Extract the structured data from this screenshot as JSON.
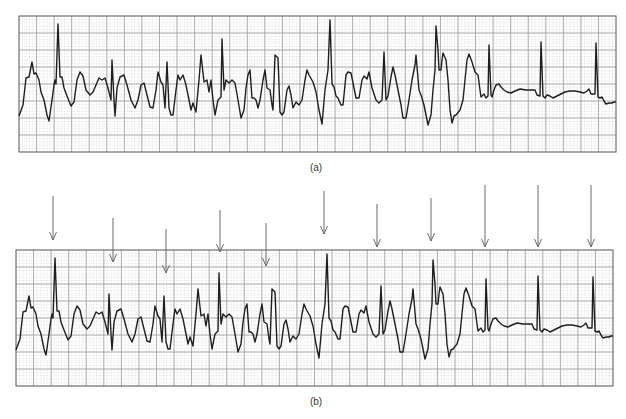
{
  "figure": {
    "panels": [
      {
        "id": "a",
        "label": "(a)",
        "box": {
          "x": 19,
          "y": 16,
          "w": 597,
          "h": 136
        },
        "label_pos": {
          "x": 316,
          "y": 162
        }
      },
      {
        "id": "b",
        "label": "(b)",
        "box": {
          "x": 16,
          "y": 250,
          "w": 597,
          "h": 136
        },
        "label_pos": {
          "x": 316,
          "y": 396
        }
      }
    ],
    "grid": {
      "major_step_x": 17.56,
      "major_step_y": 17,
      "minor_div": 5,
      "major_color": "#9a9a9a",
      "minor_color": "#c8c8c8",
      "border_color": "#555555"
    },
    "trace_color": "#1e1e1e",
    "arrow_color": "#6a6a6a"
  },
  "chart_data": {
    "type": "line",
    "title": "",
    "xlabel": "",
    "ylabel": "",
    "series": [
      {
        "name": "ECG trace (a), pixel coords within figure",
        "points": [
          [
            19,
            116
          ],
          [
            23,
            105
          ],
          [
            26,
            78
          ],
          [
            29,
            77
          ],
          [
            32,
            62
          ],
          [
            34,
            74
          ],
          [
            36,
            73
          ],
          [
            39,
            80
          ],
          [
            41,
            92
          ],
          [
            44,
            100
          ],
          [
            47,
            115
          ],
          [
            49,
            121
          ],
          [
            52,
            100
          ],
          [
            54,
            85
          ],
          [
            55,
            80
          ],
          [
            56,
            84
          ],
          [
            58,
            24
          ],
          [
            60,
            77
          ],
          [
            62,
            77
          ],
          [
            64,
            88
          ],
          [
            67,
            96
          ],
          [
            71,
            106
          ],
          [
            74,
            102
          ],
          [
            77,
            80
          ],
          [
            80,
            72
          ],
          [
            83,
            76
          ],
          [
            86,
            90
          ],
          [
            90,
            95
          ],
          [
            93,
            92
          ],
          [
            96,
            85
          ],
          [
            99,
            78
          ],
          [
            102,
            80
          ],
          [
            105,
            78
          ],
          [
            108,
            88
          ],
          [
            111,
            100
          ],
          [
            112,
            60
          ],
          [
            114,
            100
          ],
          [
            115,
            116
          ],
          [
            117,
            88
          ],
          [
            120,
            77
          ],
          [
            124,
            75
          ],
          [
            127,
            85
          ],
          [
            131,
            100
          ],
          [
            135,
            108
          ],
          [
            138,
            100
          ],
          [
            141,
            85
          ],
          [
            144,
            83
          ],
          [
            147,
            95
          ],
          [
            150,
            107
          ],
          [
            153,
            108
          ],
          [
            156,
            90
          ],
          [
            158,
            72
          ],
          [
            161,
            82
          ],
          [
            163,
            85
          ],
          [
            165,
            108
          ],
          [
            167,
            62
          ],
          [
            169,
            108
          ],
          [
            171,
            115
          ],
          [
            173,
            115
          ],
          [
            176,
            90
          ],
          [
            178,
            75
          ],
          [
            180,
            80
          ],
          [
            183,
            75
          ],
          [
            186,
            85
          ],
          [
            189,
            100
          ],
          [
            191,
            110
          ],
          [
            193,
            103
          ],
          [
            196,
            112
          ],
          [
            199,
            80
          ],
          [
            201,
            55
          ],
          [
            204,
            82
          ],
          [
            207,
            80
          ],
          [
            209,
            92
          ],
          [
            211,
            80
          ],
          [
            213,
            100
          ],
          [
            215,
            115
          ],
          [
            218,
            100
          ],
          [
            221,
            97
          ],
          [
            222,
            39
          ],
          [
            224,
            90
          ],
          [
            226,
            80
          ],
          [
            229,
            83
          ],
          [
            232,
            80
          ],
          [
            235,
            83
          ],
          [
            238,
            100
          ],
          [
            241,
            118
          ],
          [
            244,
            110
          ],
          [
            246,
            88
          ],
          [
            248,
            75
          ],
          [
            250,
            70
          ],
          [
            252,
            98
          ],
          [
            254,
            98
          ],
          [
            256,
            100
          ],
          [
            258,
            108
          ],
          [
            260,
            100
          ],
          [
            263,
            80
          ],
          [
            265,
            70
          ],
          [
            267,
            88
          ],
          [
            270,
            90
          ],
          [
            272,
            105
          ],
          [
            273,
            110
          ],
          [
            275,
            55
          ],
          [
            278,
            58
          ],
          [
            280,
            112
          ],
          [
            282,
            115
          ],
          [
            284,
            112
          ],
          [
            287,
            90
          ],
          [
            289,
            86
          ],
          [
            291,
            95
          ],
          [
            293,
            108
          ],
          [
            296,
            102
          ],
          [
            299,
            105
          ],
          [
            302,
            100
          ],
          [
            305,
            80
          ],
          [
            307,
            70
          ],
          [
            309,
            75
          ],
          [
            313,
            82
          ],
          [
            316,
            92
          ],
          [
            319,
            110
          ],
          [
            322,
            124
          ],
          [
            325,
            90
          ],
          [
            328,
            70
          ],
          [
            330,
            20
          ],
          [
            332,
            84
          ],
          [
            334,
            87
          ],
          [
            336,
            96
          ],
          [
            338,
            98
          ],
          [
            341,
            105
          ],
          [
            343,
            105
          ],
          [
            346,
            75
          ],
          [
            348,
            72
          ],
          [
            351,
            73
          ],
          [
            353,
            83
          ],
          [
            356,
            98
          ],
          [
            359,
            98
          ],
          [
            362,
            80
          ],
          [
            364,
            76
          ],
          [
            367,
            79
          ],
          [
            369,
            72
          ],
          [
            372,
            88
          ],
          [
            376,
            100
          ],
          [
            379,
            103
          ],
          [
            382,
            100
          ],
          [
            384,
            52
          ],
          [
            386,
            100
          ],
          [
            388,
            96
          ],
          [
            391,
            77
          ],
          [
            393,
            67
          ],
          [
            395,
            75
          ],
          [
            398,
            90
          ],
          [
            401,
            105
          ],
          [
            403,
            118
          ],
          [
            406,
            118
          ],
          [
            409,
            100
          ],
          [
            412,
            80
          ],
          [
            415,
            65
          ],
          [
            416,
            55
          ],
          [
            419,
            90
          ],
          [
            421,
            95
          ],
          [
            424,
            105
          ],
          [
            426,
            115
          ],
          [
            428,
            125
          ],
          [
            431,
            115
          ],
          [
            433,
            90
          ],
          [
            435,
            70
          ],
          [
            436,
            26
          ],
          [
            438,
            50
          ],
          [
            439,
            70
          ],
          [
            441,
            70
          ],
          [
            442,
            60
          ],
          [
            443,
            53
          ],
          [
            446,
            60
          ],
          [
            448,
            80
          ],
          [
            450,
            110
          ],
          [
            452,
            123
          ],
          [
            454,
            116
          ],
          [
            456,
            115
          ],
          [
            460,
            110
          ],
          [
            463,
            100
          ],
          [
            465,
            80
          ],
          [
            467,
            60
          ],
          [
            469,
            54
          ],
          [
            472,
            62
          ],
          [
            475,
            72
          ],
          [
            478,
            75
          ],
          [
            480,
            90
          ],
          [
            481,
            97
          ],
          [
            484,
            94
          ],
          [
            486,
            98
          ],
          [
            488,
            96
          ],
          [
            489,
            45
          ],
          [
            491,
            95
          ],
          [
            492,
            97
          ],
          [
            494,
            90
          ],
          [
            496,
            85
          ],
          [
            499,
            84
          ],
          [
            501,
            87
          ],
          [
            504,
            90
          ],
          [
            507,
            92
          ],
          [
            511,
            93
          ],
          [
            515,
            91
          ],
          [
            520,
            89
          ],
          [
            526,
            90
          ],
          [
            532,
            90
          ],
          [
            535,
            90
          ],
          [
            537,
            95
          ],
          [
            540,
            96
          ],
          [
            541,
            42
          ],
          [
            543,
            96
          ],
          [
            545,
            98
          ],
          [
            547,
            95
          ],
          [
            550,
            96
          ],
          [
            553,
            98
          ],
          [
            557,
            96
          ],
          [
            561,
            94
          ],
          [
            565,
            92
          ],
          [
            570,
            91
          ],
          [
            575,
            91
          ],
          [
            580,
            92
          ],
          [
            584,
            93
          ],
          [
            587,
            91
          ],
          [
            589,
            89
          ],
          [
            591,
            94
          ],
          [
            595,
            94
          ],
          [
            596,
            43
          ],
          [
            598,
            97
          ],
          [
            600,
            98
          ],
          [
            602,
            97
          ],
          [
            604,
            101
          ],
          [
            606,
            104
          ],
          [
            609,
            103
          ],
          [
            612,
            103
          ],
          [
            614,
            102
          ],
          [
            616,
            102
          ]
        ]
      }
    ],
    "panel_b_offset": {
      "dx": -3,
      "dy": 234
    },
    "arrows_panel_b": [
      {
        "x": 53,
        "y_start": 196,
        "y_tip": 240
      },
      {
        "x": 113,
        "y_start": 218,
        "y_tip": 262
      },
      {
        "x": 166,
        "y_start": 229,
        "y_tip": 273
      },
      {
        "x": 220,
        "y_start": 210,
        "y_tip": 252
      },
      {
        "x": 266,
        "y_start": 223,
        "y_tip": 266
      },
      {
        "x": 324,
        "y_start": 191,
        "y_tip": 234
      },
      {
        "x": 377,
        "y_start": 204,
        "y_tip": 247
      },
      {
        "x": 431,
        "y_start": 198,
        "y_tip": 241
      },
      {
        "x": 485,
        "y_start": 185,
        "y_tip": 247
      },
      {
        "x": 538,
        "y_start": 185,
        "y_tip": 247
      },
      {
        "x": 591,
        "y_start": 185,
        "y_tip": 247
      }
    ]
  }
}
